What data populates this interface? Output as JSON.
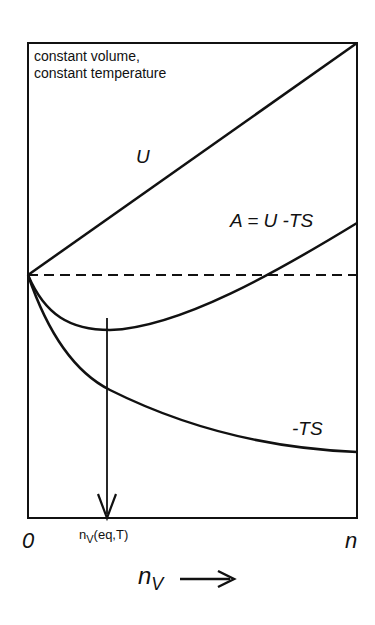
{
  "diagram": {
    "conditions": [
      "constant volume,",
      "constant temperature"
    ],
    "curves": [
      {
        "name": "U",
        "label": "U",
        "shape": "straight line rising from origin to top-right"
      },
      {
        "name": "A",
        "label": "A = U -TS",
        "shape": "dips to minimum at n_v(eq,T) then rises"
      },
      {
        "name": "-TS",
        "label": "-TS",
        "shape": "monotonically decreasing, flattening"
      }
    ],
    "reference_line": "dashed horizontal at origin value",
    "x_axis": {
      "start_label": "0",
      "end_label": "n",
      "marker_label_main": "n",
      "marker_label_sub": "V",
      "marker_label_rest": "(eq,T)",
      "axis_label_main": "n",
      "axis_label_sub": "V",
      "arrow": "⟶"
    },
    "colors": {
      "ink": "#111111",
      "background": "#ffffff"
    }
  }
}
